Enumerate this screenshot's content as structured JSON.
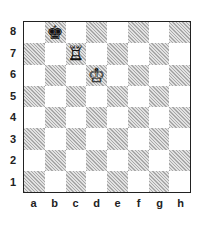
{
  "diagram": {
    "type": "chess-position",
    "files": [
      "a",
      "b",
      "c",
      "d",
      "e",
      "f",
      "g",
      "h"
    ],
    "ranks": [
      "8",
      "7",
      "6",
      "5",
      "4",
      "3",
      "2",
      "1"
    ],
    "top_left_square_color": "light",
    "pieces": [
      {
        "square": "b8",
        "color": "black",
        "type": "king",
        "glyph": "♚"
      },
      {
        "square": "c7",
        "color": "white",
        "type": "rook",
        "glyph": "♖"
      },
      {
        "square": "d6",
        "color": "white",
        "type": "king",
        "glyph": "♔"
      }
    ],
    "colors": {
      "light_square": "#ffffff",
      "dark_square_hatch": "#a8a8a8",
      "border": "#222222"
    }
  }
}
